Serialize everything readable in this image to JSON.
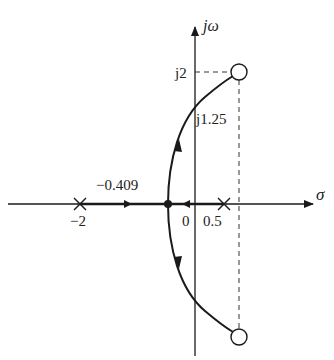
{
  "diagram": {
    "type": "root-locus",
    "axes": {
      "real_axis_label": "σ",
      "imag_axis_label": "jω"
    },
    "poles": [
      {
        "value": -2,
        "label": "−2"
      },
      {
        "value": 0.5,
        "label": "0.5"
      }
    ],
    "zeros": [
      {
        "value": "upper",
        "marker": "circle"
      },
      {
        "value": "lower",
        "marker": "circle"
      }
    ],
    "annotations": {
      "breakaway_label": "−0.409",
      "origin_label": "0",
      "jw_crossing_label": "j1.25",
      "zero_imag_label": "j2"
    },
    "colors": {
      "line": "#1a1a1a",
      "dashed": "#333333",
      "background": "#ffffff"
    }
  }
}
